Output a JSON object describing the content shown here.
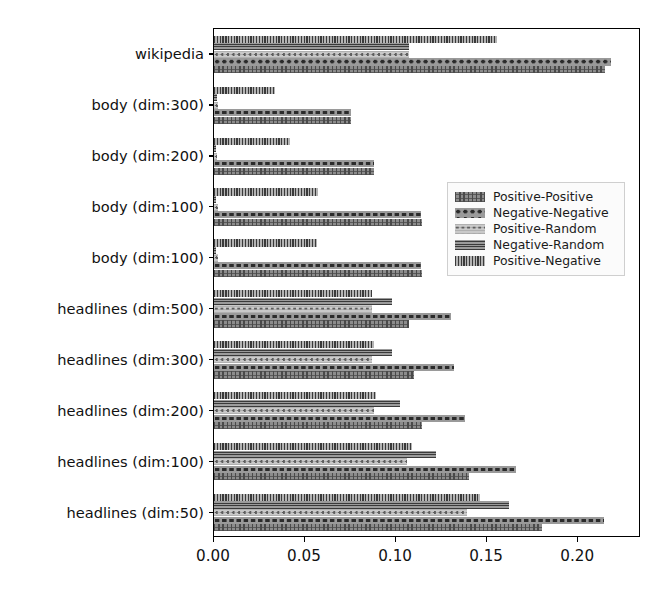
{
  "chart_data": {
    "type": "bar",
    "orientation": "horizontal",
    "title": "",
    "xlabel": "",
    "ylabel": "",
    "xlim": [
      0.0,
      0.2345
    ],
    "xticks": [
      "0.00",
      "0.05",
      "0.10",
      "0.15",
      "0.20"
    ],
    "xtick_values": [
      0.0,
      0.05,
      0.1,
      0.15,
      0.2
    ],
    "grid": false,
    "legend_position": "center right",
    "categories": [
      "wikipedia",
      "body (dim:300)",
      "body (dim:200)",
      "body (dim:100)",
      "body (dim:100)",
      "headlines (dim:500)",
      "headlines (dim:300)",
      "headlines (dim:200)",
      "headlines (dim:100)",
      "headlines (dim:50)"
    ],
    "series": [
      {
        "name": "Positive-Positive",
        "hatch": "h-pp",
        "values": [
          0.215,
          0.075,
          0.088,
          0.114,
          0.114,
          0.107,
          0.11,
          0.114,
          0.14,
          0.18
        ]
      },
      {
        "name": "Negative-Negative",
        "hatch": "h-nn",
        "values": [
          0.218,
          0.075,
          0.088,
          0.1135,
          0.1135,
          0.13,
          0.132,
          0.138,
          0.166,
          0.214
        ]
      },
      {
        "name": "Positive-Random",
        "hatch": "h-pr",
        "values": [
          0.107,
          0.002,
          0.0015,
          0.002,
          0.002,
          0.087,
          0.087,
          0.088,
          0.106,
          0.139
        ]
      },
      {
        "name": "Negative-Random",
        "hatch": "h-nr",
        "values": [
          0.107,
          0.0015,
          0.0012,
          0.0012,
          0.0012,
          0.098,
          0.098,
          0.102,
          0.122,
          0.162
        ]
      },
      {
        "name": "Positive-Negative",
        "hatch": "h-pn",
        "values": [
          0.1555,
          0.0335,
          0.0415,
          0.057,
          0.0565,
          0.087,
          0.088,
          0.089,
          0.109,
          0.146
        ]
      }
    ]
  },
  "legend": {
    "entries": [
      "Positive-Positive",
      "Negative-Negative",
      "Positive-Random",
      "Negative-Random",
      "Positive-Negative"
    ]
  },
  "colors": {
    "bar_fill": "#8e8e8e",
    "hatch_dark": "#3a3a3a",
    "axis": "#000000",
    "background": "#ffffff",
    "legend_background": "#fbfbfb",
    "legend_border": "#cfcfcf"
  }
}
